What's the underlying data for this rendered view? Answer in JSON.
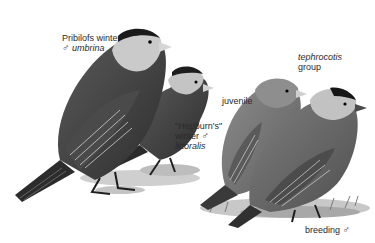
{
  "illustration": {
    "subject": "Gray-crowned Rosy-Finch plumage variants",
    "palette": {
      "background": "#ffffff",
      "dark_plumage": "#3a3a3a",
      "mid_plumage": "#6e6e6e",
      "light_plumage": "#9a9a9a",
      "pale_head": "#c8c8c8",
      "crown_black": "#1a1a1a",
      "bill": "#d0d0d0",
      "ground": "#b5b5b5"
    }
  },
  "labels": {
    "pribilofs": {
      "line1": "Pribilofs winter",
      "symbol": "♂",
      "subspecies": "umbrina"
    },
    "hepburns": {
      "line1": "\"Hepburn's\"",
      "line2": "winter",
      "symbol": "♂",
      "subspecies": "littoralis"
    },
    "tephrocotis": {
      "subspecies": "tephrocotis",
      "line2": "group"
    },
    "juvenile": {
      "text": "juvenile"
    },
    "breeding": {
      "text": "breeding",
      "symbol": "♂"
    }
  }
}
